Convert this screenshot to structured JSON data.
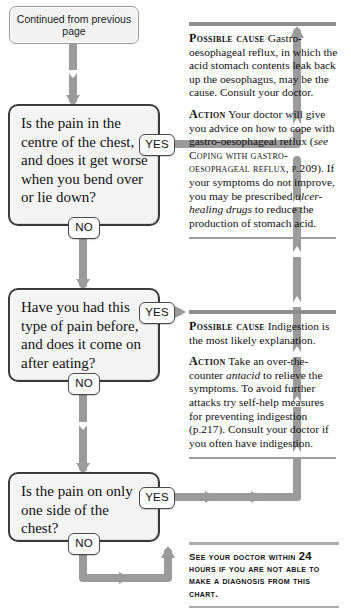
{
  "chart_title": "Chest pain diagnosis flowchart (continued)",
  "header": {
    "continued_label": "Continued from previous page"
  },
  "colors": {
    "connector": "#9b9b9b",
    "box_border": "#3a3a3a",
    "box_fill": "#f4f4f4",
    "rule_heavy": "#8d8d8d",
    "page_background": "#ffffff"
  },
  "questions": [
    {
      "id": "q1",
      "text": "Is the pain in the centre of the chest, and does it get worse when you bend over or lie down?",
      "yes_label": "YES",
      "no_label": "NO"
    },
    {
      "id": "q2",
      "text": "Have you had this type of pain before, and does it come on after eating?",
      "yes_label": "YES",
      "no_label": "NO"
    },
    {
      "id": "q3",
      "text": "Is the pain on only one side of the chest?",
      "yes_label": "YES",
      "no_label": "NO"
    }
  ],
  "panels": [
    {
      "id": "p1",
      "cause_lead": "Possible cause",
      "cause_text": "Gastro-oesophageal reflux, in which the acid stomach contents leak back up the oesophagus, may be the cause. Consult your doctor.",
      "action_lead": "Action",
      "action_part1": "Your doctor will give you advice on how to cope with gastro-oesophageal reflux (",
      "action_see": "see",
      "action_xref": "Coping with gastro-oesophageal reflux,",
      "action_xref_page": "p.209",
      "action_part2": "). If your symptoms do not improve, you may be prescribed",
      "action_italic": "ulcer-healing drugs",
      "action_part3": "to reduce the production of stomach acid."
    },
    {
      "id": "p2",
      "cause_lead": "Possible cause",
      "cause_text": "Indigestion is the most likely explanation.",
      "action_lead": "Action",
      "action_part1": "Take an over-the-counter",
      "action_italic": "antacid",
      "action_part2": "to relieve the symptoms. To avoid further attacks try self-help measures for preventing indigestion (p.217). Consult your doctor if you often have indigestion."
    }
  ],
  "warning": {
    "line1_strong": "See your doctor within",
    "line1_hours": "24",
    "line1_rest": "hours",
    "line2": "if you are not able to make a",
    "line3": "diagnosis from this chart."
  }
}
